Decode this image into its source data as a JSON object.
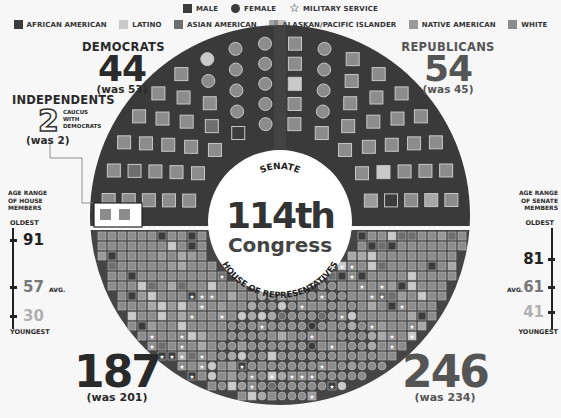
{
  "legend": {
    "shapes": [
      {
        "label": "MALE",
        "shape": "square",
        "icon": "male-square-icon"
      },
      {
        "label": "FEMALE",
        "shape": "circle",
        "icon": "female-circle-icon"
      },
      {
        "label": "MILITARY SERVICE",
        "shape": "star",
        "icon": "star-icon"
      }
    ],
    "ethnicities": [
      {
        "label": "AFRICAN AMERICAN",
        "color": "#3c3c3c"
      },
      {
        "label": "LATINO",
        "color": "#c9c9c9"
      },
      {
        "label": "ASIAN AMERICAN",
        "color": "#6e6e6e"
      },
      {
        "label": "ALASKAN/PACIFIC ISLANDER",
        "color": "#a8a8a8"
      },
      {
        "label": "NATIVE AMERICAN",
        "color": "#9a9a9a"
      },
      {
        "label": "WHITE",
        "color": "#8c8c8c"
      }
    ]
  },
  "center": {
    "title": "114th",
    "subtitle": "Congress",
    "senate_label": "SENATE",
    "house_label": "HOUSE OF REPRESENTATIVES"
  },
  "senate": {
    "democrats": {
      "name": "DEMOCRATS",
      "count": "44",
      "was": "(was 53)"
    },
    "republicans": {
      "name": "REPUBLICANS",
      "count": "54",
      "was": "(was 45)"
    },
    "independents": {
      "name": "INDEPENDENTS",
      "count": "2",
      "note": "CAUCUS WITH DEMOCRATS",
      "was": "(was 2)"
    }
  },
  "house": {
    "democrats": {
      "count": "187",
      "was": "(was 201)"
    },
    "republicans": {
      "count": "246",
      "was": "(was 234)"
    }
  },
  "age_house": {
    "title_lines": [
      "AGE RANGE",
      "OF HOUSE",
      "MEMBERS"
    ],
    "oldest_label": "OLDEST",
    "youngest_label": "YOUNGEST",
    "oldest": "91",
    "avg": "57",
    "avg_label": "AVG.",
    "youngest": "30"
  },
  "age_senate": {
    "title_lines": [
      "AGE RANGE",
      "OF SENATE",
      "MEMBERS"
    ],
    "oldest_label": "OLDEST",
    "youngest_label": "YOUNGEST",
    "oldest": "81",
    "avg": "61",
    "avg_label": "AVG.",
    "youngest": "41"
  },
  "colors": {
    "ring_bg": "#3a3a3a",
    "house_bg": "#454545",
    "center_bg": "#ffffff",
    "seat_default": "#8c8c8c",
    "seat_border": "#bdbdbd",
    "independent_box": "#ffffff"
  }
}
